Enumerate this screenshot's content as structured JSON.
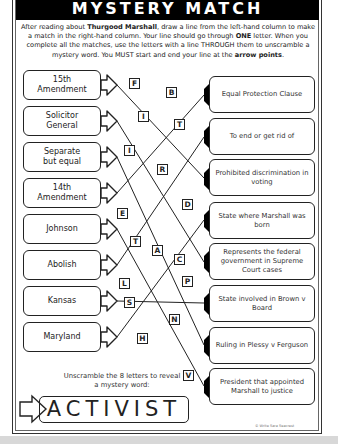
{
  "title": "MYSTERY MATCH",
  "instructions": {
    "part1": "After reading about ",
    "bold1": "Thurgood Marshall",
    "part2": ", draw a line from the left-hand column to make a match in the right-hand column. Your line should go through ",
    "bold2": "ONE",
    "part3": " letter. When you complete all the matches, use the letters with a line THROUGH them to unscramble a mystery word. You MUST start and end your line at the ",
    "bold3": "arrow points",
    "part4": "."
  },
  "left_column": [
    {
      "line1": "15th",
      "line2": "Amendment"
    },
    {
      "line1": "Solicitor",
      "line2": "General"
    },
    {
      "line1": "Separate",
      "line2": "but equal"
    },
    {
      "line1": "14th",
      "line2": "Amendment"
    },
    {
      "line1": "Johnson",
      "line2": ""
    },
    {
      "line1": "Abolish",
      "line2": ""
    },
    {
      "line1": "Kansas",
      "line2": ""
    },
    {
      "line1": "Maryland",
      "line2": ""
    }
  ],
  "right_column": [
    "Equal Protection Clause",
    "To end or get rid of",
    "Prohibited discrimination in voting",
    "State where Marshall was born",
    "Represents the federal government in Supreme Court cases",
    "State involved in Brown v Board",
    "Ruling in Plessy v Ferguson",
    "President that appointed Marshall to justice"
  ],
  "letters": [
    "F",
    "B",
    "I",
    "T",
    "I",
    "R",
    "E",
    "D",
    "T",
    "A",
    "C",
    "L",
    "P",
    "S",
    "N",
    "H",
    "V"
  ],
  "unscramble_prompt": "Unscramble the 8 letters to reveal a mystery word:",
  "answer": "ACTIVIST",
  "copyright": "© Write Sara Seacrest"
}
